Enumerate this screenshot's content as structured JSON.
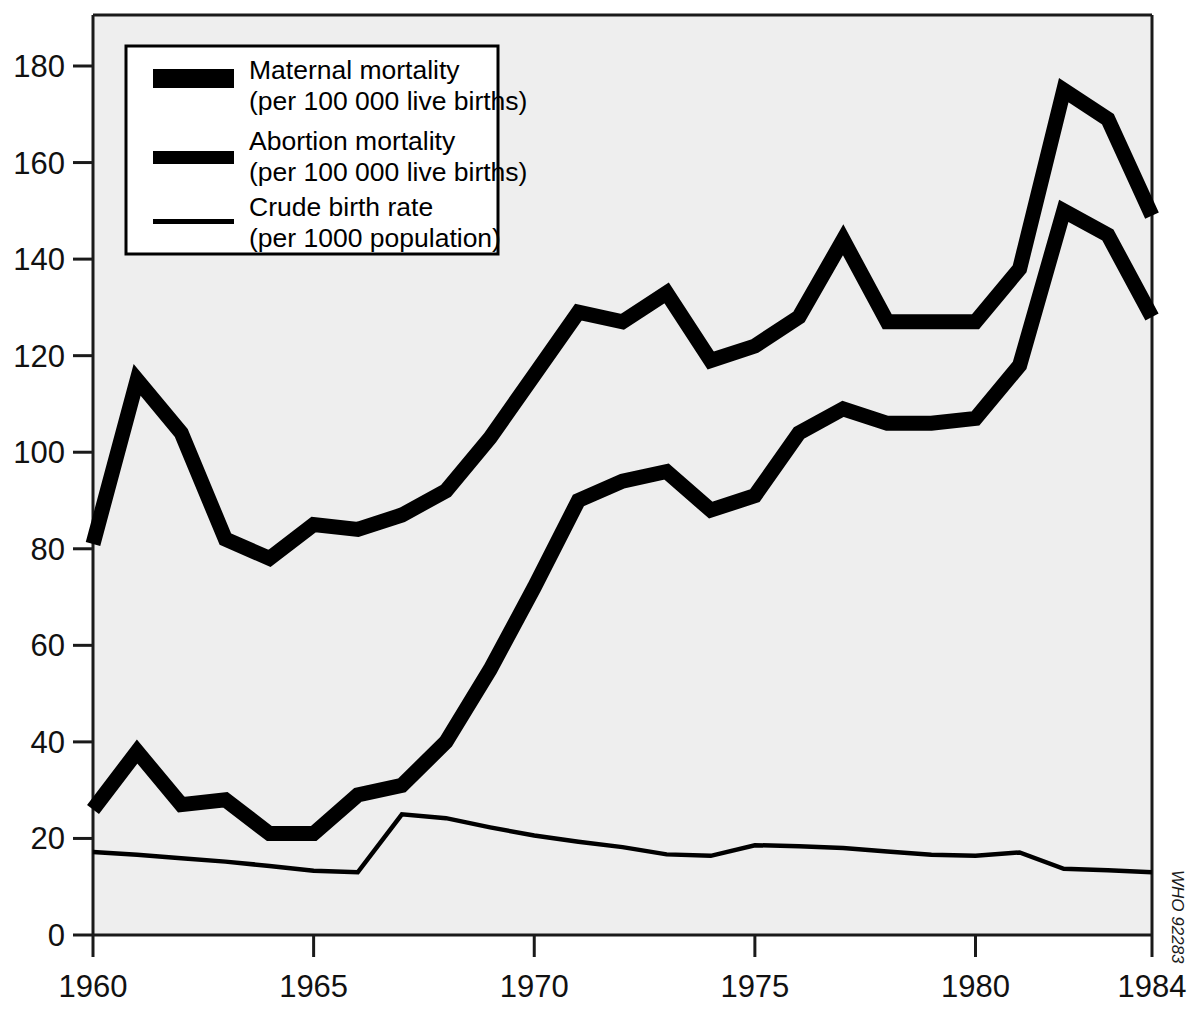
{
  "chart_data": {
    "type": "line",
    "title": "",
    "subtitle": "",
    "xlabel": "",
    "ylabel": "",
    "xlim": [
      1960,
      1984
    ],
    "ylim": [
      0,
      190
    ],
    "grid": false,
    "legend_position": "top-left",
    "x": [
      1960,
      1961,
      1962,
      1963,
      1964,
      1965,
      1966,
      1967,
      1968,
      1969,
      1970,
      1971,
      1972,
      1973,
      1974,
      1975,
      1976,
      1977,
      1978,
      1979,
      1980,
      1981,
      1982,
      1983,
      1984
    ],
    "xticks": [
      1960,
      1965,
      1970,
      1975,
      1980,
      1984
    ],
    "xticklabels": [
      "1960",
      "1965",
      "1970",
      "1975",
      "1980",
      "1984"
    ],
    "yticks": [
      0,
      20,
      40,
      60,
      80,
      100,
      120,
      140,
      160,
      180
    ],
    "yticklabels": [
      "0",
      "20",
      "40",
      "60",
      "80",
      "100",
      "120",
      "140",
      "160",
      "180"
    ],
    "series": [
      {
        "name": "Maternal mortality",
        "units": "per 100 000 live births",
        "style": "thick",
        "values": [
          81,
          115,
          104,
          82,
          78,
          85,
          84,
          87,
          92,
          103,
          116,
          129,
          127,
          133,
          119,
          122,
          128,
          144,
          127,
          127,
          127,
          138,
          175,
          169,
          149
        ]
      },
      {
        "name": "Abortion mortality",
        "units": "per 100 000 live births",
        "style": "thick",
        "values": [
          26,
          38,
          27,
          28,
          21,
          21,
          29,
          31,
          40,
          55,
          72,
          90,
          94,
          96,
          88,
          91,
          104,
          109,
          106,
          106,
          107,
          118,
          150,
          145,
          128
        ]
      },
      {
        "name": "Crude birth rate",
        "units": "per 1000 population",
        "style": "thin",
        "values": [
          17.2,
          16.6,
          15.9,
          15.2,
          14.3,
          13.3,
          13.0,
          25.0,
          24.2,
          22.3,
          20.6,
          19.3,
          18.2,
          16.7,
          16.4,
          18.6,
          18.4,
          18.0,
          17.3,
          16.6,
          16.4,
          17.1,
          13.7,
          13.4,
          13.0
        ]
      }
    ]
  },
  "legend": {
    "entries": [
      {
        "label": "Maternal mortality",
        "sublabel": "(per 100 000 live births)",
        "swatch": "thick-bar"
      },
      {
        "label": "Abortion mortality",
        "sublabel": "(per 100 000 live births)",
        "swatch": "thick-bar"
      },
      {
        "label": "Crude birth rate",
        "sublabel": "(per 1000 population)",
        "swatch": "thin-bar"
      }
    ]
  },
  "credit": {
    "text": "WHO 92283"
  }
}
